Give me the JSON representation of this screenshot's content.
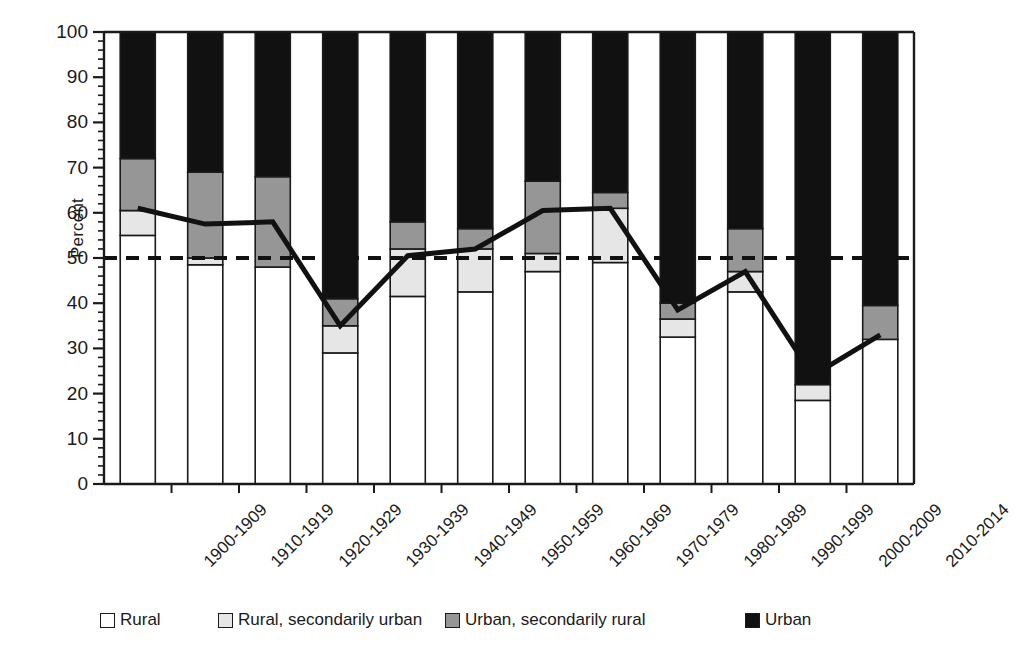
{
  "chart_data": {
    "type": "bar",
    "subtype": "stacked-bar-with-line",
    "title": "",
    "xlabel": "",
    "ylabel": "Percent",
    "ylim": [
      0,
      100
    ],
    "ytick_step": 10,
    "yticks": [
      0,
      10,
      20,
      30,
      40,
      50,
      60,
      70,
      80,
      90,
      100
    ],
    "grid": false,
    "legend_position": "bottom",
    "categories": [
      "1900-1909",
      "1910-1919",
      "1920-1929",
      "1930-1939",
      "1940-1949",
      "1950-1959",
      "1960-1969",
      "1970-1979",
      "1980-1989",
      "1990-1999",
      "2000-2009",
      "2010-2014"
    ],
    "series": [
      {
        "name": "Rural",
        "color": "#ffffff",
        "values": [
          55,
          48.5,
          48,
          29,
          41.5,
          42.5,
          47,
          49,
          32.5,
          42.5,
          18.5,
          32
        ]
      },
      {
        "name": "Rural, secondarily urban",
        "color": "#e6e6e6",
        "values": [
          5.5,
          1.5,
          0,
          6,
          10.5,
          9.5,
          4,
          12,
          4,
          4.5,
          3.5,
          0
        ]
      },
      {
        "name": "Urban, secondarily rural",
        "color": "#969696",
        "values": [
          11.5,
          19,
          20,
          6,
          6,
          4.5,
          16,
          3.5,
          3.5,
          9.5,
          0,
          7.5
        ]
      },
      {
        "name": "Urban",
        "color": "#111111",
        "values": [
          28,
          31,
          32,
          59,
          42,
          43.5,
          33,
          35.5,
          60,
          43.5,
          78,
          60.5
        ]
      }
    ],
    "line_series": {
      "name": "trend-line",
      "color": "#111111",
      "values": [
        61,
        57.5,
        58,
        35,
        50.5,
        52,
        60.5,
        61,
        38.5,
        47,
        24,
        33
      ]
    },
    "reference_line": {
      "name": "50-percent-reference",
      "value": 50,
      "style": "dashed",
      "color": "#111111"
    }
  },
  "legend": {
    "items": [
      {
        "label": "Rural",
        "swatch": "#ffffff"
      },
      {
        "label": "Rural, secondarily urban",
        "swatch": "#e6e6e6"
      },
      {
        "label": "Urban, secondarily rural",
        "swatch": "#969696"
      },
      {
        "label": "Urban",
        "swatch": "#111111"
      }
    ]
  }
}
